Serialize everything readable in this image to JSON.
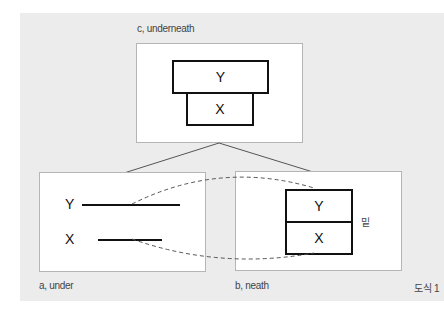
{
  "figure": {
    "caption": "도식 1",
    "panels": {
      "c": {
        "label": "c, underneath",
        "top_box": "Y",
        "bottom_box": "X"
      },
      "a": {
        "label": "a, under",
        "line_top": "Y",
        "line_bottom": "X"
      },
      "b": {
        "label": "b, neath",
        "top_box": "Y",
        "bottom_box": "X",
        "side_note": "밑"
      }
    },
    "colors": {
      "background": "#ececec",
      "panel": "#ffffff",
      "stroke": "#111111"
    }
  }
}
